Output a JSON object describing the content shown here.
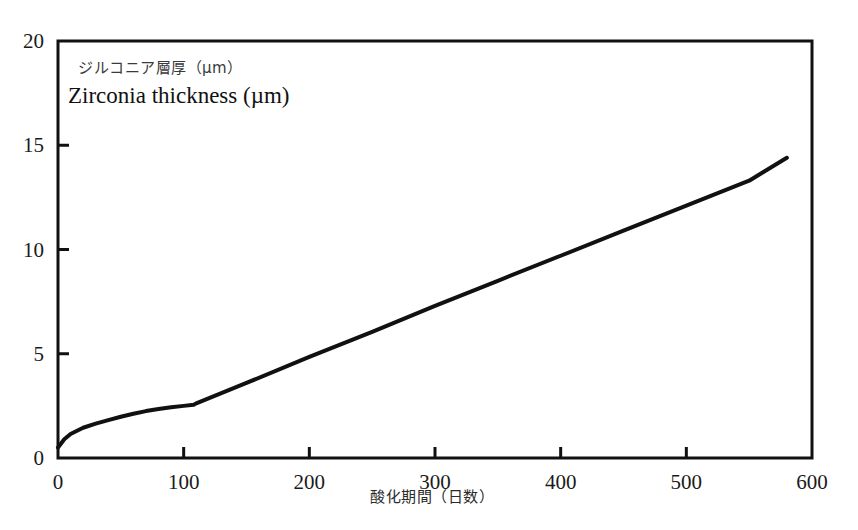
{
  "chart_data": {
    "type": "line",
    "title": "Zirconia thickness (µm)",
    "title_jp": "ジルコニア層厚（µm）",
    "xlabel": "酸化期間（日数）",
    "ylabel": "Zirconia thickness (µm)",
    "xlim": [
      0,
      600
    ],
    "ylim": [
      0,
      20
    ],
    "xticks": [
      0,
      100,
      200,
      300,
      400,
      500,
      600
    ],
    "yticks": [
      0,
      5,
      10,
      15,
      20
    ],
    "xtick_labels": [
      "0",
      "100",
      "200",
      "300",
      "400",
      "500",
      "600"
    ],
    "ytick_labels": [
      "0",
      "5",
      "10",
      "15",
      "20"
    ],
    "grid": false,
    "legend": false,
    "line_color": "#111111",
    "line_width": 4,
    "series": [
      {
        "name": "Zirconia thickness",
        "x": [
          0,
          5,
          10,
          20,
          30,
          40,
          50,
          60,
          70,
          80,
          90,
          100,
          108,
          110,
          150,
          200,
          250,
          300,
          350,
          400,
          450,
          500,
          550,
          580
        ],
        "values": [
          0.5,
          0.9,
          1.15,
          1.45,
          1.65,
          1.82,
          1.98,
          2.12,
          2.25,
          2.35,
          2.43,
          2.5,
          2.55,
          2.62,
          3.6,
          4.85,
          6.05,
          7.3,
          8.5,
          9.7,
          10.9,
          12.1,
          13.3,
          14.4
        ]
      }
    ],
    "annotations": [
      {
        "text": "slope change (kink) near day 108",
        "x": 108,
        "y": 2.55
      }
    ]
  },
  "axis": {
    "frame_color": "#111111",
    "frame_width": 3
  }
}
